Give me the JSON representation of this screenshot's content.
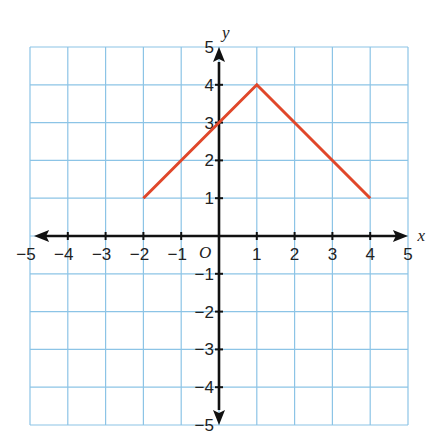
{
  "chart_data": {
    "type": "line",
    "title": "",
    "xlabel": "x",
    "ylabel": "y",
    "origin_label": "O",
    "xlim": [
      -5,
      5
    ],
    "ylim": [
      -5,
      5
    ],
    "grid": true,
    "x_ticks": [
      "-5",
      "-4",
      "-3",
      "-2",
      "-1",
      "1",
      "2",
      "3",
      "4",
      "5"
    ],
    "y_ticks": [
      "5",
      "4",
      "3",
      "2",
      "1",
      "-1",
      "-2",
      "-3",
      "-4",
      "-5"
    ],
    "series": [
      {
        "name": "graph",
        "color": "#e0472a",
        "points": [
          [
            -2,
            1
          ],
          [
            1,
            4
          ],
          [
            4,
            1
          ]
        ]
      }
    ]
  },
  "colors": {
    "grid": "#8cc4e6",
    "axis": "#111111",
    "line": "#e0472a"
  }
}
